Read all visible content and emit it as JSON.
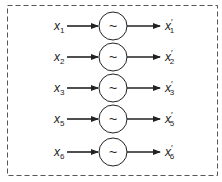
{
  "diagram": {
    "frame": {
      "style": "dashed",
      "color": "#555555"
    },
    "block_symbol": "~",
    "rows": [
      {
        "input": "x",
        "input_sub": "1",
        "output": "x",
        "output_prime": "′",
        "output_sub": "1"
      },
      {
        "input": "x",
        "input_sub": "2",
        "output": "x",
        "output_prime": "′",
        "output_sub": "2"
      },
      {
        "input": "x",
        "input_sub": "3",
        "output": "x",
        "output_prime": "′",
        "output_sub": "3"
      },
      {
        "input": "x",
        "input_sub": "5",
        "output": "x",
        "output_prime": "′",
        "output_sub": "5"
      },
      {
        "input": "x",
        "input_sub": "6",
        "output": "x",
        "output_prime": "′",
        "output_sub": "6"
      }
    ]
  }
}
